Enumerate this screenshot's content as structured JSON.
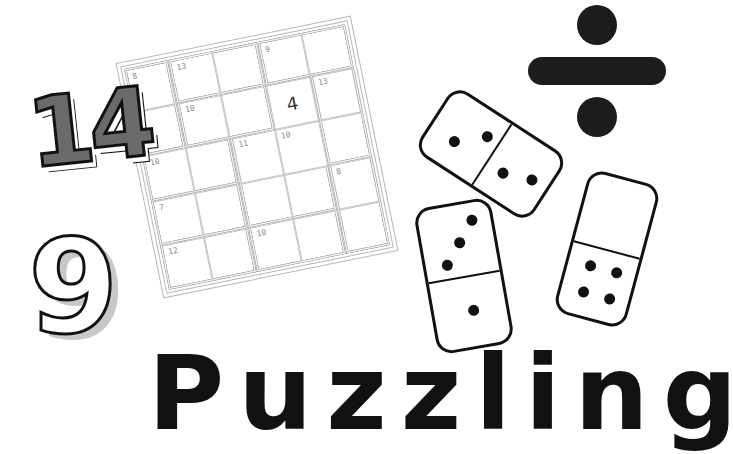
{
  "puzzle": {
    "type": "killer-5x5",
    "given": {
      "row": 1,
      "col": 3,
      "value": "4"
    },
    "clues": [
      {
        "row": 0,
        "col": 0,
        "value": "8"
      },
      {
        "row": 0,
        "col": 1,
        "value": "13"
      },
      {
        "row": 0,
        "col": 3,
        "value": "9"
      },
      {
        "row": 1,
        "col": 1,
        "value": "10"
      },
      {
        "row": 1,
        "col": 4,
        "value": "13"
      },
      {
        "row": 2,
        "col": 0,
        "value": "10"
      },
      {
        "row": 2,
        "col": 2,
        "value": "11"
      },
      {
        "row": 2,
        "col": 3,
        "value": "10"
      },
      {
        "row": 3,
        "col": 0,
        "value": "7"
      },
      {
        "row": 3,
        "col": 4,
        "value": "8"
      },
      {
        "row": 4,
        "col": 0,
        "value": "12"
      },
      {
        "row": 4,
        "col": 2,
        "value": "10"
      }
    ]
  },
  "decor": {
    "number_a": "14",
    "number_b": "9",
    "operator": "division-sign"
  },
  "dominoes": [
    {
      "name": "domino-2-2",
      "top_pips": 2,
      "bottom_pips": 2
    },
    {
      "name": "domino-3-1",
      "top_pips": 3,
      "bottom_pips": 1
    },
    {
      "name": "domino-0-4",
      "top_pips": 0,
      "bottom_pips": 4
    }
  ],
  "title": {
    "text": "Puzzling"
  },
  "colors": {
    "ink": "#111111",
    "grid": "#b8b8b8",
    "clue": "#8a8a8a",
    "shade": "#6a6a6a",
    "light_shade": "#c8c8c8"
  }
}
